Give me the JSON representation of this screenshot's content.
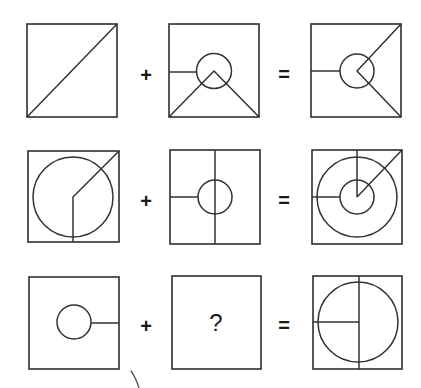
{
  "puzzle": {
    "type": "figure-addition-reasoning",
    "rows": [
      {
        "operand_a": {
          "name": "square-with-diagonal",
          "description": "square with diagonal from bottom-left to top-right"
        },
        "operator_1": "+",
        "operand_b": {
          "name": "square-circle-triangle",
          "description": "circle at center, left horizontal line, inverted V from bottom corners to circle center"
        },
        "operator_2": "=",
        "result": {
          "name": "square-circle-arrow-right",
          "description": "circle at center, left horizontal line, lines from center to top-right and bottom-right corners"
        }
      },
      {
        "operand_a": {
          "name": "square-big-circle-bent-line",
          "description": "large circle, line from bottom middle up to center then to top-right corner"
        },
        "operator_1": "+",
        "operand_b": {
          "name": "square-vertical-line-small-circle",
          "description": "full vertical middle line, small circle at center, left horizontal line"
        },
        "operator_2": "=",
        "result": {
          "name": "square-concentric-circles",
          "description": "large and small concentric circles, top vertical line to center, diagonal to top-right, left horizontal line"
        }
      },
      {
        "operand_a": {
          "name": "square-small-circle-right-line",
          "description": "small circle at center with horizontal line to right edge"
        },
        "operator_1": "+",
        "operand_b": {
          "name": "unknown",
          "label": "?"
        },
        "operator_2": "=",
        "result": {
          "name": "square-big-circle-cross",
          "description": "large circle, full vertical middle line, left horizontal line to center"
        }
      }
    ],
    "operators": {
      "plus": "+",
      "equals": "=",
      "question": "?"
    },
    "colors": {
      "line": "#333333",
      "background": "#ffffff"
    }
  }
}
